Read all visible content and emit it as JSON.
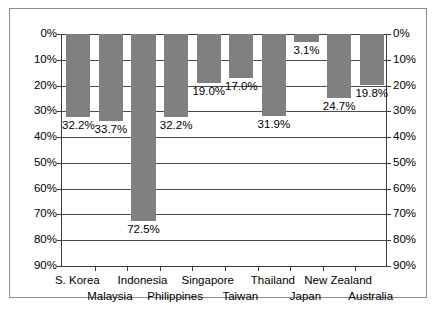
{
  "chart_data": {
    "type": "bar",
    "title": "",
    "subtitle": "",
    "xlabel": "",
    "ylabel": "",
    "orientation": "vertical-downward",
    "grid": true,
    "legend": null,
    "legend_position": "none",
    "axis_duplicated": true,
    "ylim": [
      0,
      90
    ],
    "ytick_step": 10,
    "ytick_labels": [
      "0%",
      "10%",
      "20%",
      "30%",
      "40%",
      "50%",
      "60%",
      "70%",
      "80%",
      "90%"
    ],
    "ytick_values": [
      0,
      10,
      20,
      30,
      40,
      50,
      60,
      70,
      80,
      90
    ],
    "categories": [
      "S. Korea",
      "Malaysia",
      "Indonesia",
      "Philippines",
      "Singapore",
      "Taiwan",
      "Thailand",
      "Japan",
      "New Zealand",
      "Australia"
    ],
    "values": [
      32.2,
      33.7,
      72.5,
      32.2,
      19.0,
      17.0,
      31.9,
      3.1,
      24.7,
      19.8
    ],
    "data_labels": [
      "32.2%",
      "33.7%",
      "72.5%",
      "32.2%",
      "19.0%",
      "17.0%",
      "31.9%",
      "3.1%",
      "24.7%",
      "19.8%"
    ],
    "colors": {
      "bar": "#808080",
      "plot_background": "#ffffff",
      "gridline": "#4a4a4a",
      "axis": "#3a3a3a",
      "frame_border": "#8d8d8d",
      "text": "#000000"
    }
  }
}
